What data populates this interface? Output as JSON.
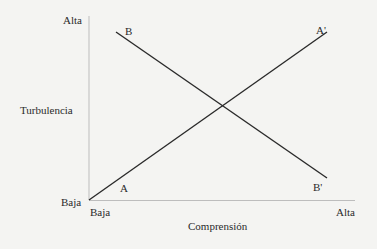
{
  "diagram": {
    "y_axis": {
      "label": "Turbulencia",
      "high": "Alta",
      "low": "Baja"
    },
    "x_axis": {
      "label": "Comprensión",
      "high": "Alta",
      "low": "Baja"
    },
    "lines": [
      {
        "name": "A-A'",
        "start_label": "A",
        "end_label": "A'",
        "direction": "increasing"
      },
      {
        "name": "B-B'",
        "start_label": "B",
        "end_label": "B'",
        "direction": "decreasing"
      }
    ],
    "colors": {
      "axis": "#b8b8b8",
      "line": "#2a2a2a",
      "background": "#f4f4f2"
    }
  }
}
